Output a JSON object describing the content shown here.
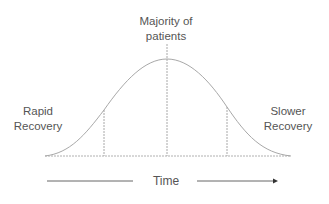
{
  "diagram": {
    "type": "bell-curve",
    "labels": {
      "peak_line1": "Majority of",
      "peak_line2": "patients",
      "left_line1": "Rapid",
      "left_line2": "Recovery",
      "right_line1": "Slower",
      "right_line2": "Recovery",
      "axis": "Time"
    },
    "colors": {
      "line": "#a8a8a8",
      "text": "#555555",
      "arrow": "#333333"
    }
  }
}
